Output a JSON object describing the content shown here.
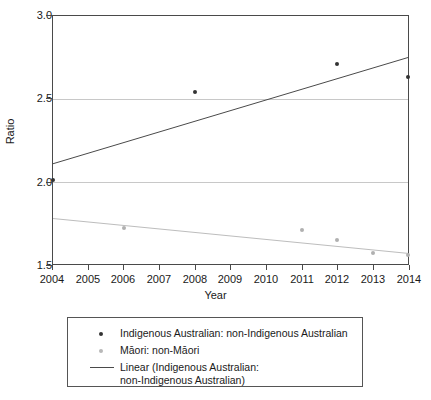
{
  "chart_data": {
    "type": "scatter",
    "title": "",
    "xlabel": "Year",
    "ylabel": "Ratio",
    "xlim": [
      2004,
      2014
    ],
    "ylim": [
      1.5,
      3.0
    ],
    "xticks": [
      "2004",
      "2005",
      "2006",
      "2007",
      "2008",
      "2009",
      "2010",
      "2011",
      "2012",
      "2013",
      "2014"
    ],
    "yticks": [
      "1.5",
      "2.0",
      "2.5",
      "3.0"
    ],
    "grid": "horizontal",
    "legend_position": "below-plot",
    "series": [
      {
        "name": "Indigenous Australian: non-Indigenous Australian",
        "marker": "dot",
        "color": "#333333",
        "x": [
          2004,
          2008,
          2012,
          2014
        ],
        "values": [
          2.01,
          2.54,
          2.71,
          2.63
        ]
      },
      {
        "name": "Māori: non-Māori",
        "marker": "dot",
        "color": "#b0b0b0",
        "x": [
          2006,
          2011,
          2012,
          2013,
          2014
        ],
        "values": [
          1.72,
          1.71,
          1.65,
          1.57,
          1.56
        ]
      }
    ],
    "trendlines": [
      {
        "name": "Linear (Indigenous Australian: non-Indigenous Australian)",
        "color": "#4a4a4a",
        "x": [
          2004,
          2014
        ],
        "values": [
          2.11,
          2.75
        ]
      },
      {
        "name": "Linear (Māori: non-Māori)",
        "color": "#b8b8b8",
        "x": [
          2004,
          2014
        ],
        "values": [
          1.78,
          1.57
        ]
      }
    ],
    "legend": [
      {
        "key": "dot-dark",
        "line1": "Indigenous Australian: non-Indigenous Australian",
        "line2": ""
      },
      {
        "key": "dot-light",
        "line1": "Māori: non-Māori",
        "line2": ""
      },
      {
        "key": "line-dark",
        "line1": "Linear (Indigenous Australian:",
        "line2": "non-Indigenous Australian)"
      }
    ]
  }
}
